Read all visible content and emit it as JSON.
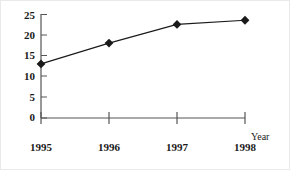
{
  "chart_data": {
    "type": "line",
    "title": "",
    "subtitle": "",
    "xlabel": "Year",
    "ylabel": "",
    "categories": [
      "1995",
      "1996",
      "1997",
      "1998"
    ],
    "values": [
      13,
      18,
      22.5,
      23.5
    ],
    "series": [
      {
        "name": "",
        "values": [
          13,
          18,
          22.5,
          23.5
        ]
      }
    ],
    "ylim": [
      0,
      25
    ],
    "yticks": [
      0,
      5,
      10,
      15,
      20,
      25
    ],
    "ytick_labels": [
      "0",
      "5",
      "10",
      "15",
      "20",
      "25"
    ],
    "xtick_labels": [
      "1995",
      "1996",
      "1997",
      "1998"
    ],
    "grid": false,
    "legend": false,
    "legend_position": "none",
    "marker": "diamond",
    "line_color": "#000000",
    "marker_color": "#000000",
    "axis_color": "#555555",
    "background": "#ffffff",
    "annotations": []
  },
  "axis": {
    "x_title": "Year",
    "y_ticks": [
      {
        "label": "25",
        "value": 25
      },
      {
        "label": "20",
        "value": 20
      },
      {
        "label": "15",
        "value": 15
      },
      {
        "label": "10",
        "value": 10
      },
      {
        "label": "5",
        "value": 5
      },
      {
        "label": "0",
        "value": 0
      }
    ],
    "x_ticks": [
      {
        "label": "1995",
        "value": 1995
      },
      {
        "label": "1996",
        "value": 1996
      },
      {
        "label": "1997",
        "value": 1997
      },
      {
        "label": "1998",
        "value": 1998
      }
    ]
  }
}
